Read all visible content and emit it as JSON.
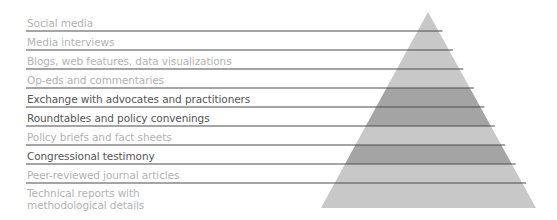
{
  "diagram": {
    "type": "pyramid",
    "colors": {
      "band_dark": "#a4a4a4",
      "band_light": "#c8c8c8",
      "rule_line": "#4d4d4d",
      "text_dark": "#555555",
      "text_light": "#b3b3b3"
    },
    "levels": [
      {
        "label": "Social media",
        "emphasis": "light"
      },
      {
        "label": "Media interviews",
        "emphasis": "light"
      },
      {
        "label": "Blogs, web features, data visualizations",
        "emphasis": "light"
      },
      {
        "label": "Op-eds and commentaries",
        "emphasis": "light"
      },
      {
        "label": "Exchange with advocates and practitioners",
        "emphasis": "dark"
      },
      {
        "label": "Roundtables and policy convenings",
        "emphasis": "dark"
      },
      {
        "label": "Policy briefs and fact sheets",
        "emphasis": "light"
      },
      {
        "label": "Congressional testimony",
        "emphasis": "dark"
      },
      {
        "label": "Peer-reviewed journal articles",
        "emphasis": "light"
      },
      {
        "label": "Technical reports with\nmethodological details",
        "emphasis": "light"
      }
    ]
  }
}
